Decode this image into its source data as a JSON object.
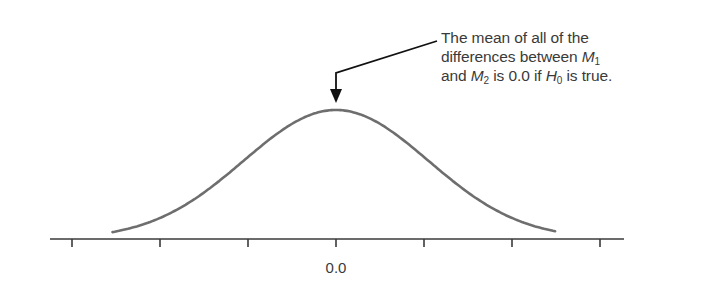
{
  "chart_data": {
    "type": "line",
    "title": "",
    "xlabel": "",
    "ylabel": "",
    "distribution": {
      "kind": "normal",
      "mean": 0.0,
      "sd": 1.05,
      "x_range": [
        -2.54,
        2.49
      ]
    },
    "x_ticks": [
      -3,
      -2,
      -1,
      0,
      1,
      2,
      3
    ],
    "x_tick_labels": [
      "",
      "",
      "",
      "0.0",
      "",
      "",
      ""
    ],
    "xlim": [
      -3.3,
      3.3
    ],
    "grid": false,
    "colors": {
      "curve": "#6e6e6e",
      "axis": "#3a3a3a",
      "arrow": "#111111",
      "text": "#3a3a3a"
    },
    "annotation": {
      "points_to": "peak (mean = 0.0)",
      "lines": [
        [
          {
            "t": "The mean of all of the"
          }
        ],
        [
          {
            "t": "differences between "
          },
          {
            "t": "M",
            "i": true
          },
          {
            "t": "1",
            "sub": true
          }
        ],
        [
          {
            "t": "and "
          },
          {
            "t": "M",
            "i": true
          },
          {
            "t": "2",
            "sub": true
          },
          {
            "t": " is 0.0 if "
          },
          {
            "t": "H",
            "i": true
          },
          {
            "t": "0",
            "sub": true
          },
          {
            "t": " is true."
          }
        ]
      ]
    }
  }
}
